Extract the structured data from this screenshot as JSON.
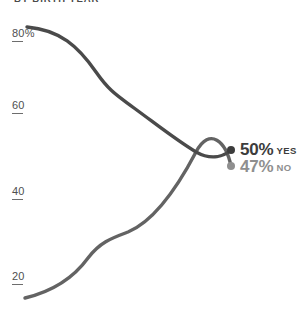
{
  "chart": {
    "title": "BY BIRTH YEAR",
    "background_color": "#ffffff"
  },
  "y_axis": {
    "ticks": [
      {
        "label": "80%"
      },
      {
        "label": "60"
      },
      {
        "label": "40"
      },
      {
        "label": "20"
      }
    ]
  },
  "callouts": {
    "yes": {
      "value": "50%",
      "answer": "YES",
      "color": "#3c3c3c"
    },
    "no": {
      "value": "47%",
      "answer": "NO",
      "color": "#8f8f8f"
    }
  },
  "chart_data": {
    "type": "line",
    "title": "BY BIRTH YEAR",
    "xlabel": "",
    "ylabel": "",
    "ylim": [
      12,
      84
    ],
    "grid": false,
    "legend": "right-endpoint-labels",
    "y_ticks": [
      80,
      60,
      40,
      20
    ],
    "y_tick_labels": [
      "80%",
      "60",
      "40",
      "20"
    ],
    "x": [
      0,
      1,
      2,
      3,
      4,
      5,
      6,
      7,
      8,
      9,
      10
    ],
    "series": [
      {
        "name": "YES",
        "color": "#4a4a4a",
        "end_value": 50,
        "end_label": "50% YES",
        "values": [
          80,
          77,
          72,
          68,
          65,
          61,
          57,
          55,
          53,
          51,
          50
        ]
      },
      {
        "name": "NO",
        "color": "#636363",
        "end_value": 47,
        "end_label": "47% NO",
        "values": [
          17,
          18,
          20,
          24,
          28,
          31,
          35,
          39,
          43,
          46,
          47
        ]
      }
    ],
    "crossing_point": {
      "x": 7.8,
      "y": 48
    },
    "paths": {
      "yes": "M 27,27 C 60,30 78,46 96,72 C 110,92 118,96 134,108 C 156,124 176,140 196,152 C 212,161 224,156 231,150",
      "no": "M 25,298 C 50,292 72,280 88,258 C 100,242 112,238 128,232 C 152,222 176,190 196,152 C 210,126 226,142 231,166"
    },
    "endpoints": [
      {
        "series": "YES",
        "px": 231,
        "py": 150
      },
      {
        "series": "NO",
        "px": 231,
        "py": 166
      }
    ]
  }
}
